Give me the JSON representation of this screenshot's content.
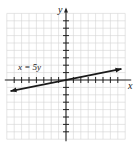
{
  "chart_data": {
    "type": "line",
    "title": "",
    "xlabel": "x",
    "ylabel": "y",
    "xlim": [
      -8,
      8
    ],
    "ylim": [
      -8,
      9
    ],
    "grid": true,
    "tick_labels": false,
    "series": [
      {
        "name": "x = 5y",
        "equation": "x = 5y",
        "x": [
          -7.5,
          0,
          7.5
        ],
        "y": [
          -1.5,
          0,
          1.5
        ],
        "arrows": "both"
      }
    ],
    "annotations": [
      {
        "text": "x = 5y",
        "x": -6,
        "y": 2.3
      }
    ]
  },
  "labels": {
    "x_axis": "x",
    "y_axis": "y",
    "line_label": "x = 5y"
  },
  "colors": {
    "grid": "#d4d4d4",
    "axis": "#222222",
    "line": "#1a1a1a"
  }
}
